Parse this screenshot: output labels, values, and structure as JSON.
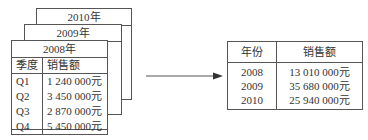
{
  "left_sheets": [
    {
      "title": "2010年"
    },
    {
      "title": "2009年"
    },
    {
      "title": "2008年",
      "headers": [
        "季度",
        "销售额"
      ],
      "rows": [
        {
          "quarter": "Q1",
          "sales": "1 240 000元"
        },
        {
          "quarter": "Q2",
          "sales": "3 450 000元"
        },
        {
          "quarter": "Q3",
          "sales": "2 870 000元"
        },
        {
          "quarter": "Q4",
          "sales": "5 450 000元"
        }
      ]
    }
  ],
  "arrow": {
    "direction": "right"
  },
  "summary_table": {
    "headers": [
      "年份",
      "销售额"
    ],
    "rows": [
      {
        "year": "2008",
        "sales": "13 010 000元"
      },
      {
        "year": "2009",
        "sales": "35 680 000元"
      },
      {
        "year": "2010",
        "sales": "25 940 000元"
      }
    ]
  }
}
